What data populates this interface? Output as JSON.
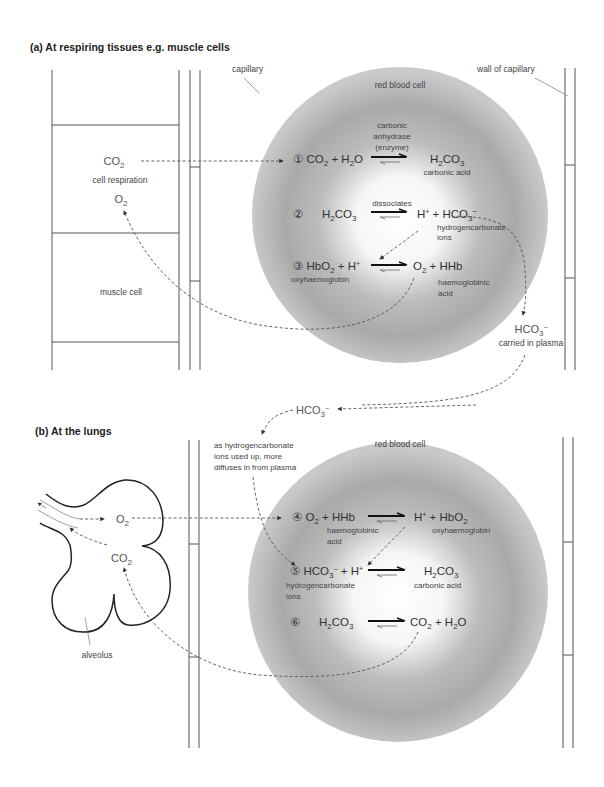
{
  "section_a": {
    "title": "(a) At respiring tissues e.g. muscle cells",
    "labels": {
      "capillary": "capillary",
      "wall_of_capillary": "wall of capillary",
      "red_blood_cell": "red blood cell",
      "muscle_cell": "muscle cell",
      "cell_respiration": "cell respiration",
      "co2": "CO",
      "co2_sub": "2",
      "o2": "O",
      "o2_sub": "2",
      "hco3_plasma": "HCO",
      "hco3_plasma_sub": "3",
      "hco3_plasma_sup": "−",
      "carried_in_plasma": "carried in plasma"
    },
    "reactions": [
      {
        "step": "①",
        "left": [
          {
            "t": "CO",
            "sub": "2"
          },
          {
            "t": " + "
          },
          {
            "t": "H",
            "sub": "2"
          },
          {
            "t": "O"
          }
        ],
        "arrow_label": [
          "carbonic",
          "anhydrase",
          "(enzyme)"
        ],
        "right": [
          {
            "t": "H",
            "sub": "2"
          },
          {
            "t": "CO",
            "sub": "3"
          }
        ],
        "right_caption": [
          "carbonic acid"
        ]
      },
      {
        "step": "②",
        "left": [
          {
            "t": "H",
            "sub": "2"
          },
          {
            "t": "CO",
            "sub": "3"
          }
        ],
        "arrow_label": [
          "dissociates"
        ],
        "right": [
          {
            "t": "H",
            "sup": "+"
          },
          {
            "t": "  +  "
          },
          {
            "t": "HCO",
            "sub": "3",
            "sup": "−"
          }
        ],
        "right_caption": [
          "hydrogencarbonate",
          "ions"
        ]
      },
      {
        "step": "③",
        "left": [
          {
            "t": "HbO",
            "sub": "2"
          },
          {
            "t": " + "
          },
          {
            "t": "H",
            "sup": "+"
          }
        ],
        "left_caption": [
          "oxyhaemoglobin"
        ],
        "arrow_label": [],
        "right": [
          {
            "t": "O",
            "sub": "2"
          },
          {
            "t": "   +   "
          },
          {
            "t": "HHb"
          }
        ],
        "right_caption": [
          "haemoglobinic",
          "acid"
        ]
      }
    ]
  },
  "section_b": {
    "title": "(b) At the lungs",
    "labels": {
      "red_blood_cell": "red blood cell",
      "alveolus": "alveolus",
      "o2": "O",
      "o2_sub": "2",
      "co2": "CO",
      "co2_sub": "2",
      "hco3": "HCO",
      "hco3_sub": "3",
      "hco3_sup": "−",
      "diffuse_note": [
        "as hydrogencarbonate",
        "ions used up, more",
        "diffuses in from plasma"
      ]
    },
    "reactions": [
      {
        "step": "④",
        "left": [
          {
            "t": "O",
            "sub": "2"
          },
          {
            "t": "  +  "
          },
          {
            "t": "HHb"
          }
        ],
        "left_caption": [
          "haemoglobinic",
          "acid"
        ],
        "right": [
          {
            "t": "H",
            "sup": "+"
          },
          {
            "t": "   +  "
          },
          {
            "t": "HbO",
            "sub": "2"
          }
        ],
        "right_caption": [
          "oxyhaemoglobin"
        ]
      },
      {
        "step": "⑤",
        "left": [
          {
            "t": "HCO",
            "sub": "3",
            "sup": "−"
          },
          {
            "t": " + "
          },
          {
            "t": "H",
            "sup": "+"
          }
        ],
        "left_caption": [
          "hydrogencarbonate",
          "ions"
        ],
        "right": [
          {
            "t": "H",
            "sub": "2"
          },
          {
            "t": "CO",
            "sub": "3"
          }
        ],
        "right_caption": [
          "carbonic acid"
        ]
      },
      {
        "step": "⑥",
        "left": [
          {
            "t": "H",
            "sub": "2"
          },
          {
            "t": "CO",
            "sub": "3"
          }
        ],
        "right": [
          {
            "t": "CO",
            "sub": "2"
          },
          {
            "t": " + "
          },
          {
            "t": "H",
            "sub": "2"
          },
          {
            "t": "O"
          }
        ]
      }
    ]
  },
  "colors": {
    "rbc_edge": "#a8a8a8",
    "rbc_mid": "#bdbdbd",
    "rbc_center": "#ffffff",
    "line": "#555555",
    "text": "#333333"
  }
}
